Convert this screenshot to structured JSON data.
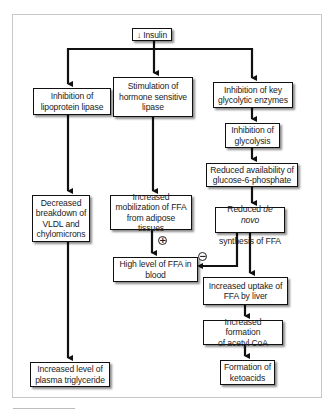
{
  "diagram": {
    "root": {
      "arrow_symbol": "↓",
      "label": "Insulin"
    },
    "nodes": {
      "lipoprotein_lipase": "Inhibition of\nlipoprotein lipase",
      "hormone_sensitive_lipase": "Stimulation of\nhormone sensitive\nlipase",
      "glycolytic_enzymes": "Inhibition of key\nglycolytic enzymes",
      "glycolysis": "Inhibition of\nglycolysis",
      "glucose6p": "Reduced availability of\nglucose-6-phosphate",
      "denovo_prefix": "Reduced ",
      "denovo_italic": "de novo",
      "denovo_suffix": "synthesis of FFA",
      "vldl_breakdown": "Decreased\nbreakdown of\nVLDL and\nchylomicrons",
      "ffa_mobilization": "Increased\nmobilization of FFA\nfrom adipose tissues",
      "high_ffa_blood": "High level of FFA in\nblood",
      "ffa_uptake_liver": "Increased uptake of\nFFA by liver",
      "acetyl_coa": "Increased formation\nof acetyl CoA",
      "ketoacids": "Formation of\nketoacids",
      "plasma_triglyceride": "Increased level of\nplasma triglyceride"
    },
    "signs": {
      "positive": "+",
      "negative": "−"
    },
    "edges": [
      {
        "from": "Insulin",
        "to": "Inhibition of lipoprotein lipase"
      },
      {
        "from": "Insulin",
        "to": "Stimulation of hormone sensitive lipase"
      },
      {
        "from": "Insulin",
        "to": "Inhibition of key glycolytic enzymes"
      },
      {
        "from": "Inhibition of key glycolytic enzymes",
        "to": "Inhibition of glycolysis"
      },
      {
        "from": "Inhibition of glycolysis",
        "to": "Reduced availability of glucose-6-phosphate"
      },
      {
        "from": "Reduced availability of glucose-6-phosphate",
        "to": "Reduced de novo synthesis of FFA"
      },
      {
        "from": "Inhibition of lipoprotein lipase",
        "to": "Decreased breakdown of VLDL and chylomicrons"
      },
      {
        "from": "Stimulation of hormone sensitive lipase",
        "to": "Increased mobilization of FFA from adipose tissues"
      },
      {
        "from": "Increased mobilization of FFA from adipose tissues",
        "to": "High level of FFA in blood",
        "sign": "+"
      },
      {
        "from": "Reduced de novo synthesis of FFA",
        "to": "High level of FFA in blood",
        "sign": "−"
      },
      {
        "from": "Reduced de novo synthesis of FFA",
        "to": "Increased uptake of FFA by liver"
      },
      {
        "from": "Increased uptake of FFA by liver",
        "to": "Increased formation of acetyl CoA"
      },
      {
        "from": "Increased formation of acetyl CoA",
        "to": "Formation of ketoacids"
      },
      {
        "from": "Decreased breakdown of VLDL and chylomicrons",
        "to": "Increased level of plasma triglyceride"
      }
    ],
    "colors": {
      "line": "#111111",
      "frame": "#c8c8c8",
      "text": "#222222"
    }
  }
}
